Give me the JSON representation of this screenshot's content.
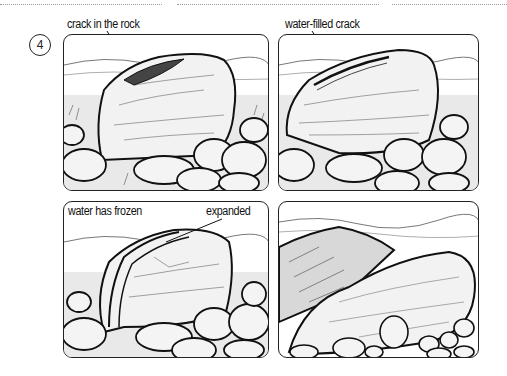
{
  "step": {
    "number": "4"
  },
  "panels": [
    {
      "id": "p1",
      "label": "crack in the rock",
      "description": "Boulder with an open crack on top"
    },
    {
      "id": "p2",
      "label": "water-filled crack",
      "description": "Boulder with water filling the crack"
    },
    {
      "id": "p3",
      "label": "water has frozen",
      "label2": "expanded",
      "description": "Frozen water expanded, widening the crack"
    },
    {
      "id": "p4",
      "description": "Boulder split into two pieces"
    }
  ],
  "colors": {
    "ink": "#111111",
    "paper": "#ffffff",
    "dotted_rule": "#9a9a9a"
  }
}
